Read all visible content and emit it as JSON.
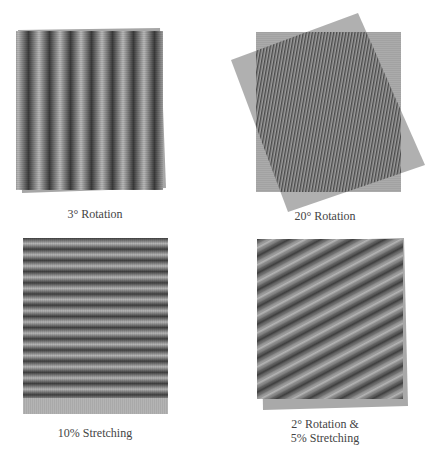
{
  "figure": {
    "panels": [
      {
        "id": "rotation-3",
        "caption_lines": [
          "3° Rotation"
        ],
        "pattern": "vertical-moire-fringes",
        "rotation_deg": 3,
        "stretch_pct": 0,
        "fringe_count": 7,
        "colors": {
          "dark": "#3a3a3a",
          "light": "#b8b8b8",
          "base": "#9a9a9a"
        }
      },
      {
        "id": "rotation-20",
        "caption_lines": [
          "20° Rotation"
        ],
        "pattern": "fine-vertical-lines-overlap",
        "rotation_deg": 20,
        "stretch_pct": 0,
        "colors": {
          "dark": "#4a4a4a",
          "light": "#a8a8a8",
          "base": "#a9a9a9"
        }
      },
      {
        "id": "stretching-10",
        "caption_lines": [
          "10% Stretching"
        ],
        "pattern": "horizontal-moire-fringes",
        "rotation_deg": 0,
        "stretch_pct": 10,
        "fringe_count": 14,
        "colors": {
          "dark": "#444444",
          "light": "#b5b5b5",
          "base": "#b0b0b0"
        }
      },
      {
        "id": "rotation-2-stretching-5",
        "caption_lines": [
          "2° Rotation &",
          "5% Stretching"
        ],
        "pattern": "diagonal-moire-fringes",
        "rotation_deg": 2,
        "stretch_pct": 5,
        "fringe_count": 12,
        "colors": {
          "dark": "#454545",
          "light": "#b3b3b3",
          "base": "#a8a8a8"
        }
      }
    ]
  }
}
